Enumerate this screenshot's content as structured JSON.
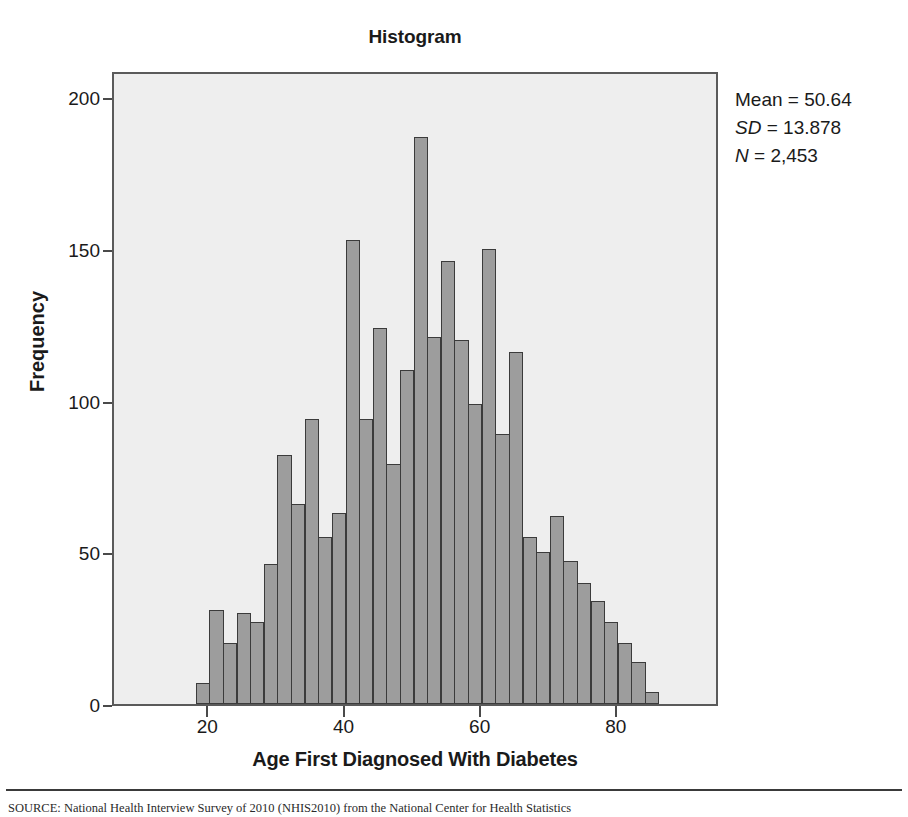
{
  "chart_data": {
    "type": "bar",
    "title": "Histogram",
    "xlabel": "Age First Diagnosed With Diabetes",
    "ylabel": "Frequency",
    "xlim": [
      6,
      95
    ],
    "ylim": [
      0,
      209
    ],
    "grid": false,
    "bin_width": 2,
    "bin_start": 18,
    "xticks": [
      20,
      40,
      60,
      80
    ],
    "xtick_labels": [
      "20",
      "40",
      "60",
      "80"
    ],
    "yticks": [
      0,
      50,
      100,
      150,
      200
    ],
    "ytick_labels": [
      "0",
      "50",
      "100",
      "150",
      "200"
    ],
    "categories": [
      "18-20",
      "20-22",
      "22-24",
      "24-26",
      "26-28",
      "28-30",
      "30-32",
      "32-34",
      "34-36",
      "36-38",
      "38-40",
      "40-42",
      "42-44",
      "44-46",
      "46-48",
      "48-50",
      "50-52",
      "52-54",
      "54-56",
      "56-58",
      "58-60",
      "60-62",
      "62-64",
      "64-66",
      "66-68",
      "68-70",
      "70-72",
      "72-74",
      "74-76",
      "76-78",
      "78-80",
      "80-82",
      "82-84",
      "84-86"
    ],
    "values": [
      7,
      31,
      20,
      30,
      27,
      46,
      82,
      66,
      94,
      55,
      63,
      153,
      94,
      124,
      79,
      110,
      187,
      121,
      146,
      120,
      99,
      150,
      89,
      116,
      55,
      50,
      62,
      47,
      40,
      34,
      27,
      20,
      14,
      4
    ],
    "annotations": {
      "mean_label": "Mean = 50.64",
      "sd_symbol": "SD",
      "sd_value": " = 13.878",
      "n_symbol": "N",
      "n_value": " = 2,453",
      "mean": 50.64,
      "sd": 13.878,
      "n": 2453
    },
    "colors": {
      "bar_fill": "#9d9d9d",
      "bar_stroke": "#3b3b3b",
      "plot_background": "#eeeeee",
      "frame": "#5a5a5a",
      "text": "#1a1a1a"
    }
  },
  "footer": {
    "source_note": "SOURCE: National Health Interview Survey of 2010 (NHIS2010) from the National Center for Health Statistics"
  }
}
